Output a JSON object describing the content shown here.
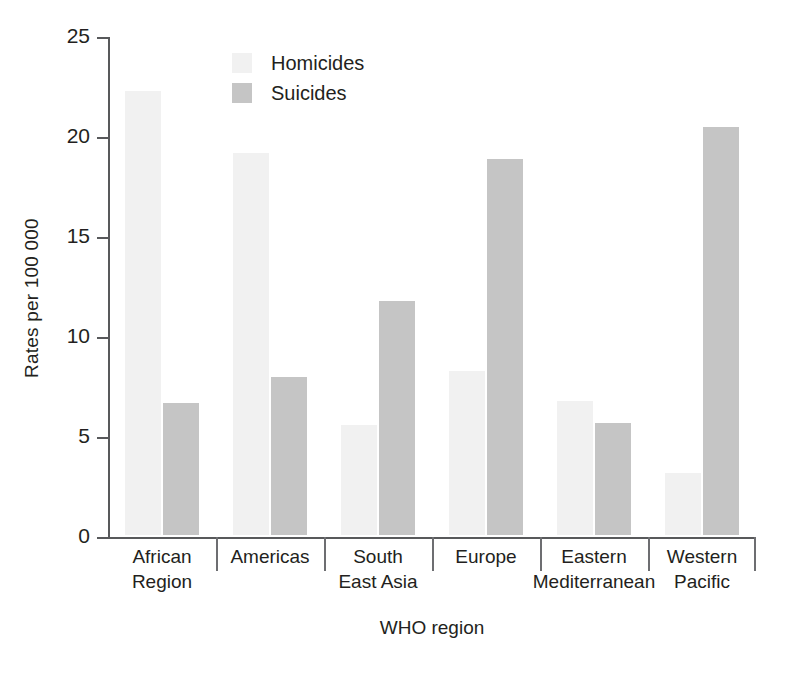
{
  "chart_data": {
    "type": "bar",
    "title": "",
    "xlabel": "WHO region",
    "ylabel": "Rates per 100 000",
    "categories": [
      "African Region",
      "Americas",
      "South East Asia",
      "Europe",
      "Eastern Mediterranean",
      "Western Pacific"
    ],
    "category_lines": [
      [
        "African",
        "Region"
      ],
      [
        "Americas",
        ""
      ],
      [
        "South",
        "East Asia"
      ],
      [
        "Europe",
        ""
      ],
      [
        "Eastern",
        "Mediterranean"
      ],
      [
        "Western",
        "Pacific"
      ]
    ],
    "series": [
      {
        "name": "Homicides",
        "color": "#f1f1f1",
        "values": [
          22.2,
          19.1,
          5.5,
          8.2,
          6.7,
          3.1
        ]
      },
      {
        "name": "Suicides",
        "color": "#c5c5c5",
        "values": [
          6.6,
          7.9,
          11.7,
          18.8,
          5.6,
          20.4
        ]
      }
    ],
    "ylim": [
      0,
      25
    ],
    "yticks": [
      0,
      5,
      10,
      15,
      20,
      25
    ],
    "ytick_labels": [
      "0",
      "5",
      "10",
      "15",
      "20",
      "25"
    ],
    "grid": false,
    "legend_position": "top-left-inside"
  },
  "legend": {
    "items": [
      {
        "label": "Homicides",
        "swatch": "homicides"
      },
      {
        "label": "Suicides",
        "swatch": "suicides"
      }
    ]
  }
}
